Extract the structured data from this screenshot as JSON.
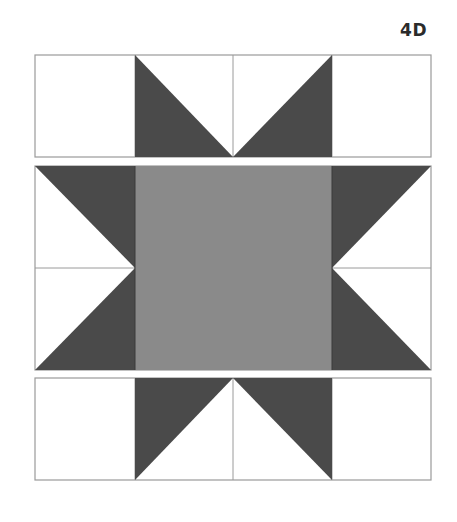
{
  "figure": {
    "label": "4D",
    "colors": {
      "background": "#ffffff",
      "dark": "#4a4a4a",
      "medium": "#8a8a8a",
      "outline": "#9a9a9a",
      "light": "#ffffff"
    },
    "layout": {
      "columns_x": [
        35,
        135,
        233,
        332,
        431
      ],
      "rows": {
        "top": [
          55,
          157
        ],
        "middle": [
          166,
          370
        ],
        "bottom": [
          378,
          480
        ]
      }
    }
  }
}
